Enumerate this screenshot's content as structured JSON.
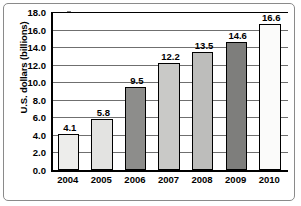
{
  "chart_data": {
    "type": "bar",
    "title": "",
    "xlabel": "",
    "ylabel": "U.S. dollars (billions)",
    "categories": [
      "2004",
      "2005",
      "2006",
      "2007",
      "2008",
      "2009",
      "2010"
    ],
    "values": [
      4.1,
      5.8,
      9.5,
      12.2,
      13.5,
      14.6,
      16.6
    ],
    "value_labels": [
      "4.1",
      "5.8",
      "9.5",
      "12.2",
      "13.5",
      "14.6",
      "16.6"
    ],
    "ylim": [
      0.0,
      18.0
    ],
    "ytick_labels": [
      "0.0",
      "2.0",
      "4.0",
      "6.0",
      "8.0",
      "10.0",
      "12.0",
      "14.0",
      "16.0",
      "18.0"
    ],
    "ytick_values": [
      0.0,
      2.0,
      4.0,
      6.0,
      8.0,
      10.0,
      12.0,
      14.0,
      16.0,
      18.0
    ],
    "ytick_step": 2.0,
    "grid": "horizontal",
    "legend": "none",
    "bar_colors": [
      "#ededeb",
      "#e3e3e1",
      "#8d8d8b",
      "#c9c9c7",
      "#bdbdbb",
      "#7e7e7c",
      "#fbfbfa"
    ],
    "bar_edge_color": "#000000",
    "gridline_color": "#6f6f6f",
    "axis_color": "#000000",
    "background_color": "#ffffff",
    "frame_color": "#8a8a8a"
  }
}
